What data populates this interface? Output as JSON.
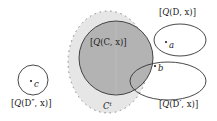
{
  "diagram": {
    "colors": {
      "outer_region_fill": "#e6e6e6",
      "outer_region_dots": "#888888",
      "inner_circle_fill": "#b3b3b3",
      "stroke": "#333333",
      "text": "#222222"
    },
    "regions": {
      "outer_label_base": "C",
      "outer_label_sup": "t",
      "QC": {
        "prefix": "[",
        "q": "Q",
        "args": "(C, x)",
        "suffix": "]"
      },
      "QD": {
        "prefix": "[",
        "q": "Q",
        "args": "(D, x)",
        "suffix": "]"
      },
      "QDprime": {
        "prefix": "[",
        "q": "Q",
        "args": "(D′, x)",
        "suffix": "]"
      },
      "QDdoubleprime": {
        "prefix": "[",
        "q": "Q",
        "args": "(D″, x)",
        "suffix": "]"
      }
    },
    "points": [
      {
        "label": "a"
      },
      {
        "label": "b"
      },
      {
        "label": "c"
      }
    ]
  }
}
